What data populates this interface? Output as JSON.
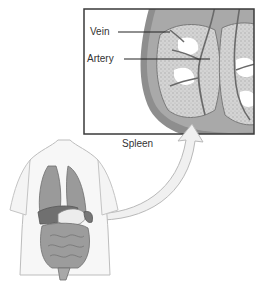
{
  "diagram": {
    "inset_caption": "Spleen",
    "callouts": [
      {
        "label": "Vein"
      },
      {
        "label": "Artery"
      }
    ],
    "colors": {
      "frame": "#3a3a3a",
      "tissue": "#c8c8c8",
      "capsule": "#8a8a8a",
      "vessel": "#6a6a6a",
      "body_outline": "#bdbdbd",
      "organ_dark": "#7d7d7d",
      "organ_mid": "#9d9d9d",
      "arrow_fill": "#f0f0f0"
    }
  }
}
